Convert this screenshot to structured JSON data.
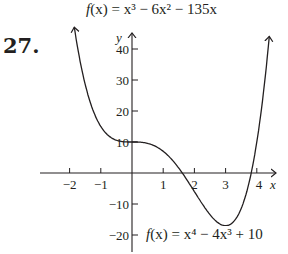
{
  "problem": {
    "number": "27."
  },
  "captions": {
    "top": {
      "prefix": "f",
      "arg": "(x)",
      "rest": " = x³ − 6x² − 135x",
      "full": "f(x) = x³ − 6x² − 135x"
    },
    "bottom": {
      "prefix": "f",
      "arg": "(x)",
      "rest": " = x⁴ − 4x³ + 10",
      "full": "f(x) = x⁴ − 4x³ + 10"
    }
  },
  "axes": {
    "x_label": "x",
    "y_label": "y",
    "x_ticks": [
      "−2",
      "−1",
      "1",
      "2",
      "3",
      "4"
    ],
    "y_ticks": [
      "40",
      "30",
      "20",
      "10",
      "−10",
      "−20"
    ]
  },
  "colors": {
    "ink": "#231f20",
    "background": "#ffffff"
  },
  "chart_data": {
    "type": "line",
    "title": "f(x) = x³ − 6x² − 135x",
    "function_plotted": "f(x) = x⁴ − 4x³ + 10",
    "xlabel": "x",
    "ylabel": "y",
    "xlim": [
      -2.2,
      4.6
    ],
    "ylim": [
      -22,
      45
    ],
    "x_ticks": [
      -2,
      -1,
      1,
      2,
      3,
      4
    ],
    "y_ticks": [
      -20,
      -10,
      10,
      20,
      30,
      40
    ],
    "grid": false,
    "legend": "none",
    "series": [
      {
        "name": "f(x) = x⁴ − 4x³ + 10",
        "x": [
          -1.85,
          -1.5,
          -1,
          -0.5,
          0,
          0.5,
          1,
          1.5,
          2,
          2.5,
          3,
          3.5,
          4,
          4.4
        ],
        "y": [
          46.1,
          28.6,
          15,
          10.6,
          10,
          9.6,
          7,
          -1.4,
          -6,
          -13.4,
          -17,
          -11.4,
          10,
          44.1
        ]
      }
    ],
    "annotations": [
      "27.",
      "f(x) = x³ − 6x² − 135x",
      "f(x) = x⁴ − 4x³ + 10"
    ]
  }
}
